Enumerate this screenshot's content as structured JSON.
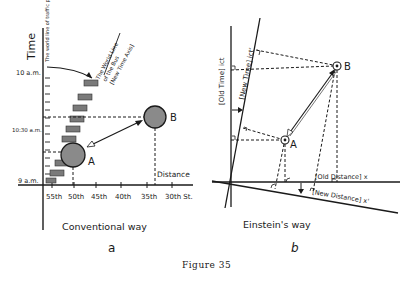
{
  "figure": {
    "caption": "Figure 35"
  },
  "panel_a": {
    "label": "a",
    "title": "Conventional way",
    "y_axis_label": "Time",
    "x_axis_label": "Distance",
    "time_ticks": [
      "10 a.m.",
      "10:30 a.m.",
      "9 a.m."
    ],
    "street_ticks": [
      "55th",
      "50th",
      "45th",
      "40th",
      "35th",
      "30th St."
    ],
    "worldline_pedestrian": "The world line of traffic policeman",
    "worldline_bus_1": "The World Line",
    "worldline_bus_2": "of the Bus",
    "worldline_bus_3": "[New Time Axis]",
    "event_a": "A",
    "event_b": "B"
  },
  "panel_b": {
    "label": "b",
    "title": "Einstein's way",
    "old_time_axis": "[Old Time] ict",
    "new_time_axis": "[New Time] ict'",
    "old_distance_axis": "[Old Distance] x",
    "new_distance_axis": "[New Distance] x'",
    "event_a": "A",
    "event_b": "B"
  }
}
